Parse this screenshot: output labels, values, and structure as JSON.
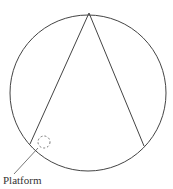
{
  "diagram": {
    "label": "Platform",
    "colors": {
      "stroke": "#444444",
      "background": "#ffffff"
    },
    "circle": {
      "cx": 88,
      "cy": 93,
      "r": 78
    },
    "apex": {
      "x": 89,
      "y": 13
    },
    "left_chord_end": {
      "x": 30,
      "y": 144
    },
    "right_chord_end": {
      "x": 144,
      "y": 146
    },
    "platform_marker": {
      "cx": 44,
      "cy": 142,
      "r": 6,
      "style": "dashed"
    }
  }
}
